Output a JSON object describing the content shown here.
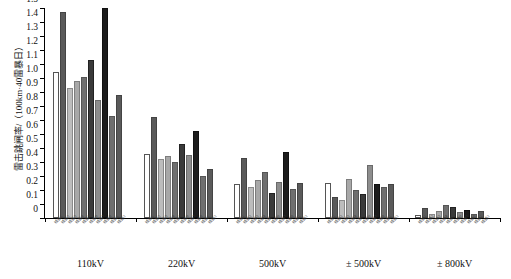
{
  "chart": {
    "type": "bar",
    "ylabel": "雷击跳闸率/（100km·40雷暴日）",
    "ymin": 0,
    "ymax": 1.5,
    "ystep": 0.1,
    "yticklabels": [
      "1.5",
      "1.4",
      "1.3",
      "1.2",
      "1.1",
      "1.0",
      "0.9",
      "0.8",
      "0.7",
      "0.6",
      "0.5",
      "0.4",
      "0.3",
      "0.2",
      "0.1",
      "0"
    ]
  },
  "chart_data": {
    "type": "bar",
    "title": "",
    "xlabel": "",
    "ylabel": "雷击跳闸率/（100km·40雷暴日）",
    "ylim": [
      0,
      1.5
    ],
    "grid": false,
    "legend": "none",
    "categories": [
      "110kV",
      "220kV",
      "500kV",
      "± 500kV",
      "± 800kV"
    ],
    "series_labels": [
      "线路1",
      "线路2",
      "线路3",
      "线路4",
      "线路5",
      "线路6",
      "线路7",
      "线路8"
    ],
    "groups": [
      {
        "category": "110kV",
        "values": [
          1.04,
          1.47,
          0.93,
          0.98,
          1.01,
          1.13,
          0.84,
          1.5,
          0.73,
          0.88
        ]
      },
      {
        "category": "220kV",
        "values": [
          0.46,
          0.72,
          0.42,
          0.44,
          0.4,
          0.53,
          0.45,
          0.62,
          0.3,
          0.35
        ]
      },
      {
        "category": "500kV",
        "values": [
          0.24,
          0.43,
          0.22,
          0.27,
          0.33,
          0.18,
          0.26,
          0.47,
          0.21,
          0.25
        ]
      },
      {
        "category": "± 500kV",
        "values": [
          0.25,
          0.15,
          0.13,
          0.28,
          0.2,
          0.17,
          0.38,
          0.24,
          0.22,
          0.24
        ]
      },
      {
        "category": "± 800kV",
        "values": [
          0.02,
          0.07,
          0.03,
          0.05,
          0.09,
          0.08,
          0.04,
          0.06,
          0.03,
          0.05
        ]
      }
    ]
  },
  "xlabels": {
    "groups": [
      {
        "caption": "110kV"
      },
      {
        "caption": "220kV"
      },
      {
        "caption": "500kV"
      },
      {
        "caption": "± 500kV"
      },
      {
        "caption": "± 800kV"
      }
    ]
  }
}
